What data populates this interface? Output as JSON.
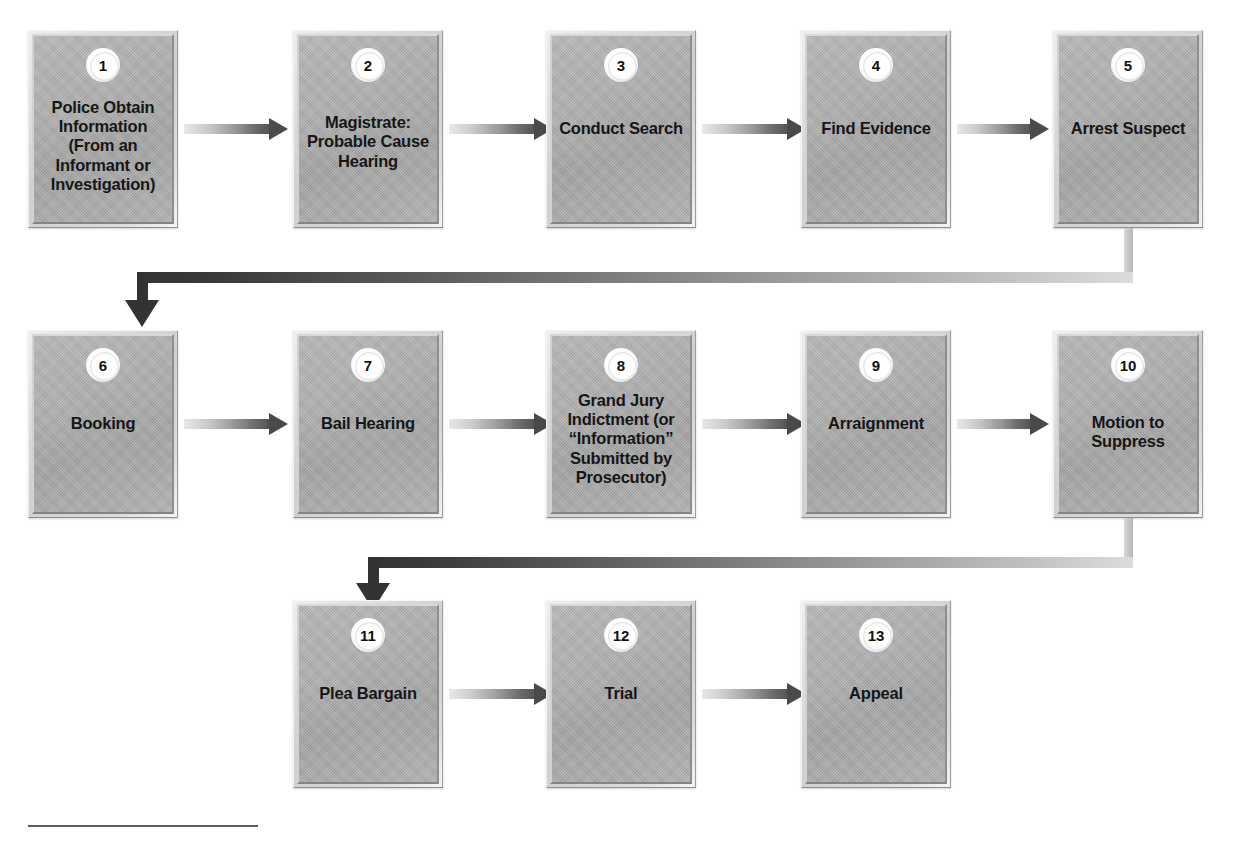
{
  "diagram": {
    "background_color": "#ffffff",
    "box_fill_color": "#aeaeae",
    "arrow_color": "#4a4a4a",
    "connector_color": "#333333",
    "badge_color": "#ffffff",
    "text_color": "#161616"
  },
  "nodes": [
    {
      "number": "1",
      "label": "Police Obtain\nInformation\n(From an\nInformant or\nInvestigation)"
    },
    {
      "number": "2",
      "label": "Magistrate:\nProbable Cause\nHearing"
    },
    {
      "number": "3",
      "label": "Conduct Search"
    },
    {
      "number": "4",
      "label": "Find Evidence"
    },
    {
      "number": "5",
      "label": "Arrest Suspect"
    },
    {
      "number": "6",
      "label": "Booking"
    },
    {
      "number": "7",
      "label": "Bail Hearing"
    },
    {
      "number": "8",
      "label": "Grand Jury\nIndictment (or\n“Information”\nSubmitted by\nProsecutor)"
    },
    {
      "number": "9",
      "label": "Arraignment"
    },
    {
      "number": "10",
      "label": "Motion to\nSuppress"
    },
    {
      "number": "11",
      "label": "Plea Bargain"
    },
    {
      "number": "12",
      "label": "Trial"
    },
    {
      "number": "13",
      "label": "Appeal"
    }
  ],
  "connections": [
    {
      "from": "1",
      "to": "2",
      "type": "arrow-right"
    },
    {
      "from": "2",
      "to": "3",
      "type": "arrow-right"
    },
    {
      "from": "3",
      "to": "4",
      "type": "arrow-right"
    },
    {
      "from": "4",
      "to": "5",
      "type": "arrow-right"
    },
    {
      "from": "5",
      "to": "6",
      "type": "wrap-around-down"
    },
    {
      "from": "6",
      "to": "7",
      "type": "arrow-right"
    },
    {
      "from": "7",
      "to": "8",
      "type": "arrow-right"
    },
    {
      "from": "8",
      "to": "9",
      "type": "arrow-right"
    },
    {
      "from": "9",
      "to": "10",
      "type": "arrow-right"
    },
    {
      "from": "10",
      "to": "11",
      "type": "wrap-around-down"
    },
    {
      "from": "11",
      "to": "12",
      "type": "arrow-right"
    },
    {
      "from": "12",
      "to": "13",
      "type": "arrow-right"
    }
  ]
}
